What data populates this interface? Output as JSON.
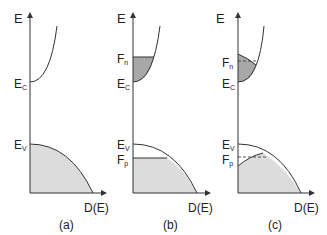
{
  "figure": {
    "panels": [
      {
        "id": "a",
        "caption": "(a)",
        "y_axis_label": "E",
        "x_axis_label": "D(E)",
        "levels": [
          {
            "main": "E",
            "sub": "C"
          },
          {
            "main": "E",
            "sub": "V"
          }
        ]
      },
      {
        "id": "b",
        "caption": "(b)",
        "y_axis_label": "E",
        "x_axis_label": "D(E)",
        "levels": [
          {
            "main": "F",
            "sub": "n"
          },
          {
            "main": "E",
            "sub": "C"
          },
          {
            "main": "E",
            "sub": "V"
          },
          {
            "main": "F",
            "sub": "p"
          }
        ]
      },
      {
        "id": "c",
        "caption": "(c)",
        "y_axis_label": "E",
        "x_axis_label": "D(E)",
        "levels": [
          {
            "main": "F",
            "sub": "n"
          },
          {
            "main": "E",
            "sub": "C"
          },
          {
            "main": "E",
            "sub": "V"
          },
          {
            "main": "F",
            "sub": "p"
          }
        ]
      }
    ],
    "colors": {
      "line": "#333333",
      "valence_fill": "#dcdcdc",
      "conduction_fill": "#a8a8a8"
    }
  }
}
